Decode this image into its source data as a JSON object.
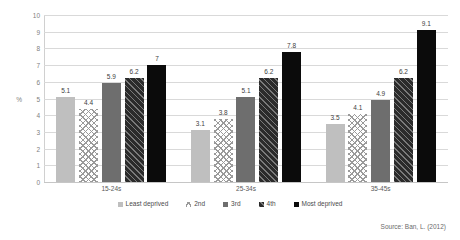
{
  "chart_data": {
    "type": "bar",
    "title": "",
    "subtitle": "",
    "xlabel": "",
    "ylabel": "%",
    "ylim": [
      0,
      10
    ],
    "yticks": [
      0,
      1,
      2,
      3,
      4,
      5,
      6,
      7,
      8,
      9,
      10
    ],
    "ytick_labels": [
      "0",
      "1",
      "2",
      "3",
      "4",
      "5",
      "6",
      "7",
      "8",
      "9",
      "10"
    ],
    "grid": true,
    "legend_position": "bottom",
    "categories": [
      "15-24s",
      "25-34s",
      "35-45s"
    ],
    "series": [
      {
        "name": "Least deprived",
        "values": [
          5.1,
          3.1,
          3.5
        ],
        "color": "#bfbfbf",
        "pattern": "solid-light-gray"
      },
      {
        "name": "2nd",
        "values": [
          4.4,
          3.8,
          4.1
        ],
        "color": "#ffffff",
        "pattern": "crosshatch"
      },
      {
        "name": "3rd",
        "values": [
          5.9,
          5.1,
          4.9
        ],
        "color": "#6e6e6e",
        "pattern": "solid-mid-gray"
      },
      {
        "name": "4th",
        "values": [
          6.2,
          6.2,
          6.2
        ],
        "color": "#2b2b2b",
        "pattern": "diagonal-hatch-dark"
      },
      {
        "name": "Most deprived",
        "values": [
          7.0,
          7.8,
          9.1
        ],
        "color": "#0b0b0b",
        "pattern": "solid-black"
      }
    ],
    "data_labels": [
      [
        "5.1",
        "4.4",
        "5.9",
        "6.2",
        "7"
      ],
      [
        "3.1",
        "3.8",
        "5.1",
        "6.2",
        "7.8"
      ],
      [
        "3.5",
        "4.1",
        "4.9",
        "6.2",
        "9.1"
      ]
    ],
    "annotations": [
      "Source: Ban, L. (2012)"
    ]
  },
  "source_note": "Source: Ban, L. (2012)"
}
